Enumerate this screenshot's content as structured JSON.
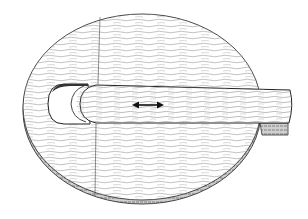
{
  "figure": {
    "description": "Technical line drawing of a round wooden disc with a slot, and a rounded wooden bar sliding within the slot",
    "parts": [
      {
        "name": "disc",
        "label": "Round wooden base with wood grain"
      },
      {
        "name": "slot",
        "label": "Rounded-end slot cut into disc"
      },
      {
        "name": "bar",
        "label": "Sliding wooden bar extending past disc edge"
      },
      {
        "name": "motion-arrow",
        "label": "Double-headed arrow indicating sliding motion"
      }
    ],
    "colors": {
      "background": "#ffffff",
      "line": "#333333",
      "grain": "#9a9a9a",
      "edge_shade": "#6e6e6e"
    }
  }
}
